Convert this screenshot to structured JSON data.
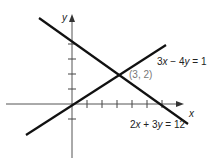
{
  "diagram": {
    "axes": {
      "x_label": "x",
      "y_label": "y"
    },
    "lines": [
      {
        "equation": "3x − 4y = 1",
        "label_parts": [
          "3",
          "x",
          " − 4",
          "y",
          " = 1"
        ]
      },
      {
        "equation": "2x + 3y = 12",
        "label_parts": [
          "2",
          "x",
          " + 3",
          "y",
          " = 12"
        ]
      }
    ],
    "intersection": {
      "label": "(3, 2)",
      "x": 3,
      "y": 2
    },
    "x_ticks": [
      1,
      2,
      3,
      4,
      5,
      6
    ],
    "y_ticks": [
      -1,
      1,
      2,
      3,
      4
    ]
  }
}
